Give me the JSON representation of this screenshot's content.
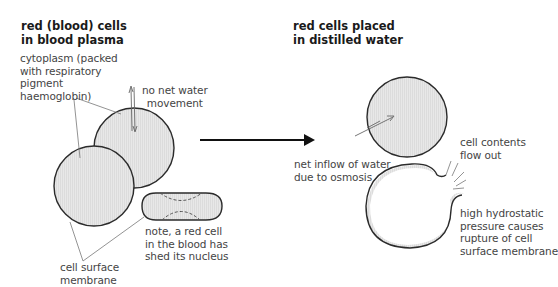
{
  "left_panel": {
    "title": [
      "red (blood) cells",
      "in blood plasma"
    ],
    "labels": {
      "cytoplasm": [
        "cytoplasm (packed",
        "with respiratory",
        "pigment",
        "haemoglobin)"
      ],
      "no_net_water": [
        "no net water",
        "movement"
      ],
      "membrane": [
        "cell surface",
        "membrane"
      ],
      "note": [
        "note, a red cell",
        "in the blood has",
        "shed its nucleus"
      ]
    }
  },
  "right_panel": {
    "title": [
      "red cells placed",
      "in distilled water"
    ],
    "labels": {
      "net_inflow": [
        "net inflow of water",
        "due to osmosis"
      ],
      "contents_flow": [
        "cell contents",
        "flow out"
      ],
      "rupture": [
        "high hydrostatic",
        "pressure causes",
        "rupture of cell",
        "surface membrane"
      ]
    }
  },
  "colors": {
    "cell_fill": "#e6e6e6",
    "cell_outline": "#2b2b2b",
    "leader_line": "#777777",
    "arrow": "#111111",
    "title_text": "#1a1a1a",
    "label_text": "#444444"
  }
}
